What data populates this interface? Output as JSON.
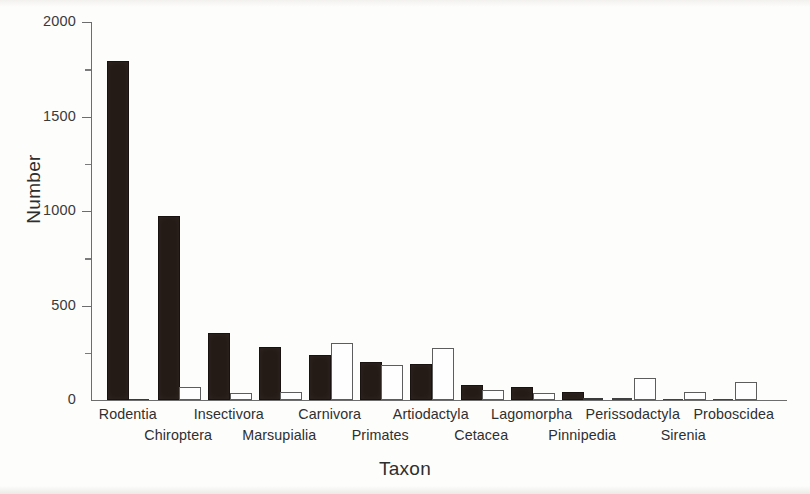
{
  "chart_data": {
    "type": "bar",
    "title": "",
    "xlabel": "Taxon",
    "ylabel": "Number",
    "ylim": [
      0,
      2000
    ],
    "ytick_values": [
      0,
      500,
      1000,
      1500,
      2000
    ],
    "ytick_labels": [
      "0",
      "500",
      "1000",
      "1500",
      "2000"
    ],
    "yminor_tick_values": [
      250,
      750,
      1250,
      1750
    ],
    "grid": false,
    "legend": "none",
    "categories": [
      "Rodentia",
      "Chiroptera",
      "Insectivora",
      "Marsupialia",
      "Carnivora",
      "Primates",
      "Artiodactyla",
      "Cetacea",
      "Lagomorpha",
      "Pinnipedia",
      "Perissodactyla",
      "Sirenia",
      "Proboscidea"
    ],
    "series": [
      {
        "name": "filled",
        "style": "solid-black",
        "values": [
          1785,
          963,
          345,
          270,
          228,
          190,
          180,
          70,
          58,
          30,
          12,
          5,
          2
        ]
      },
      {
        "name": "open",
        "style": "open-white",
        "values": [
          4,
          60,
          25,
          30,
          290,
          175,
          265,
          42,
          25,
          12,
          105,
          30,
          85
        ]
      }
    ]
  },
  "axes": {
    "y_title": "Number",
    "x_title": "Taxon"
  }
}
